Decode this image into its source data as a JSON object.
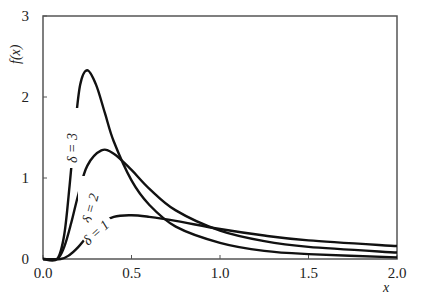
{
  "chart_data": {
    "type": "line",
    "title": "",
    "xlabel": "x",
    "ylabel": "f(x)",
    "xlim": [
      0,
      2.0
    ],
    "ylim": [
      0,
      3
    ],
    "grid": false,
    "legend_position": "inline annotations",
    "x_ticks": [
      "0.0",
      "0.5",
      "1.0",
      "1.5",
      "2.0"
    ],
    "y_ticks": [
      "0",
      "1",
      "2",
      "3"
    ],
    "series": [
      {
        "name": "δ = 3",
        "x": [
          0.0,
          0.08,
          0.12,
          0.15,
          0.18,
          0.21,
          0.25,
          0.3,
          0.35,
          0.4,
          0.5,
          0.6,
          0.75,
          1.0,
          1.25,
          1.5,
          2.0
        ],
        "y": [
          0.0,
          0.0,
          0.3,
          0.9,
          1.6,
          2.15,
          2.33,
          2.15,
          1.8,
          1.45,
          0.97,
          0.67,
          0.4,
          0.2,
          0.1,
          0.06,
          0.02
        ]
      },
      {
        "name": "δ = 2",
        "x": [
          0.0,
          0.08,
          0.12,
          0.16,
          0.2,
          0.25,
          0.33,
          0.4,
          0.5,
          0.6,
          0.75,
          1.0,
          1.25,
          1.5,
          2.0
        ],
        "y": [
          0.0,
          0.0,
          0.15,
          0.45,
          0.8,
          1.15,
          1.34,
          1.3,
          1.1,
          0.87,
          0.6,
          0.35,
          0.22,
          0.15,
          0.08
        ]
      },
      {
        "name": "δ = 1",
        "x": [
          0.0,
          0.1,
          0.15,
          0.2,
          0.25,
          0.3,
          0.4,
          0.5,
          0.6,
          0.75,
          1.0,
          1.25,
          1.5,
          2.0
        ],
        "y": [
          0.0,
          0.0,
          0.05,
          0.15,
          0.28,
          0.4,
          0.52,
          0.54,
          0.52,
          0.47,
          0.37,
          0.29,
          0.23,
          0.16
        ]
      }
    ],
    "annotations": [
      "δ = 3",
      "δ = 2",
      "δ = 1"
    ]
  },
  "axes": {
    "xlabel": "x",
    "ylabel": "f(x)"
  }
}
